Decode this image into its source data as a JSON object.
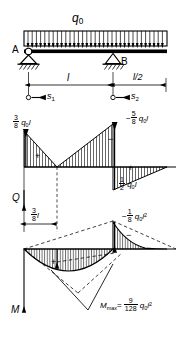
{
  "figure": {
    "type": "beam-diagram",
    "title_symbols": {
      "load": "q",
      "load_sub": "0",
      "support_a": "A",
      "support_b": "B",
      "shear_axis": "Q",
      "moment_axis": "M"
    },
    "dimensions": [
      {
        "id": "span",
        "label": "l"
      },
      {
        "id": "overhang",
        "label": "l/2"
      },
      {
        "id": "shear_zero",
        "num": "3",
        "den": "8",
        "unit": "l"
      }
    ],
    "coordinates": [
      {
        "id": "s1",
        "label": "s",
        "sub": "1"
      },
      {
        "id": "s2",
        "label": "s",
        "sub": "2"
      }
    ],
    "shear_values": [
      {
        "id": "reaction-a",
        "sign": "",
        "num": "3",
        "den": "8",
        "unit": "q",
        "unit_sub": "0",
        "unit2": "l"
      },
      {
        "id": "left-of-b",
        "sign": "−",
        "num": "5",
        "den": "8",
        "unit": "q",
        "unit_sub": "0",
        "unit2": "l"
      },
      {
        "id": "right-of-b",
        "sign": "",
        "num": "1",
        "den": "2",
        "unit": "q",
        "unit_sub": "0",
        "unit2": "l"
      }
    ],
    "moment_values": [
      {
        "id": "moment-at-b",
        "sign": "−",
        "num": "1",
        "den": "8",
        "unit": "q",
        "unit_sub": "0",
        "unit2": "l",
        "exp": "2"
      },
      {
        "id": "moment-max",
        "label": "M",
        "label_sub": "max",
        "eq": "=",
        "num": "9",
        "den": "128",
        "unit": "q",
        "unit_sub": "0",
        "unit2": "l",
        "exp": "2"
      }
    ],
    "hatch_signs": [
      {
        "id": "shear-left-sign",
        "glyph": "+"
      },
      {
        "id": "shear-mid-sign",
        "glyph": "−"
      },
      {
        "id": "shear-right-sign",
        "glyph": "+"
      },
      {
        "id": "moment-left-sign",
        "glyph": "+"
      },
      {
        "id": "moment-right-sign",
        "glyph": "−"
      }
    ],
    "colors": {
      "ink": "#000000",
      "paper": "#ffffff"
    }
  }
}
